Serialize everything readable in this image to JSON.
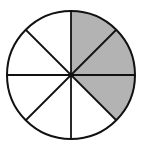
{
  "figure": {
    "type": "fraction-circle",
    "total_sectors": 8,
    "shaded_sectors": [
      0,
      1,
      2
    ],
    "shaded_count": 3,
    "fraction_shaded": "3/8",
    "center": [
      71,
      75
    ],
    "radius": 64,
    "colors": {
      "shade": "#b3b3b3",
      "fill": "#ffffff",
      "stroke": "#111111"
    }
  }
}
